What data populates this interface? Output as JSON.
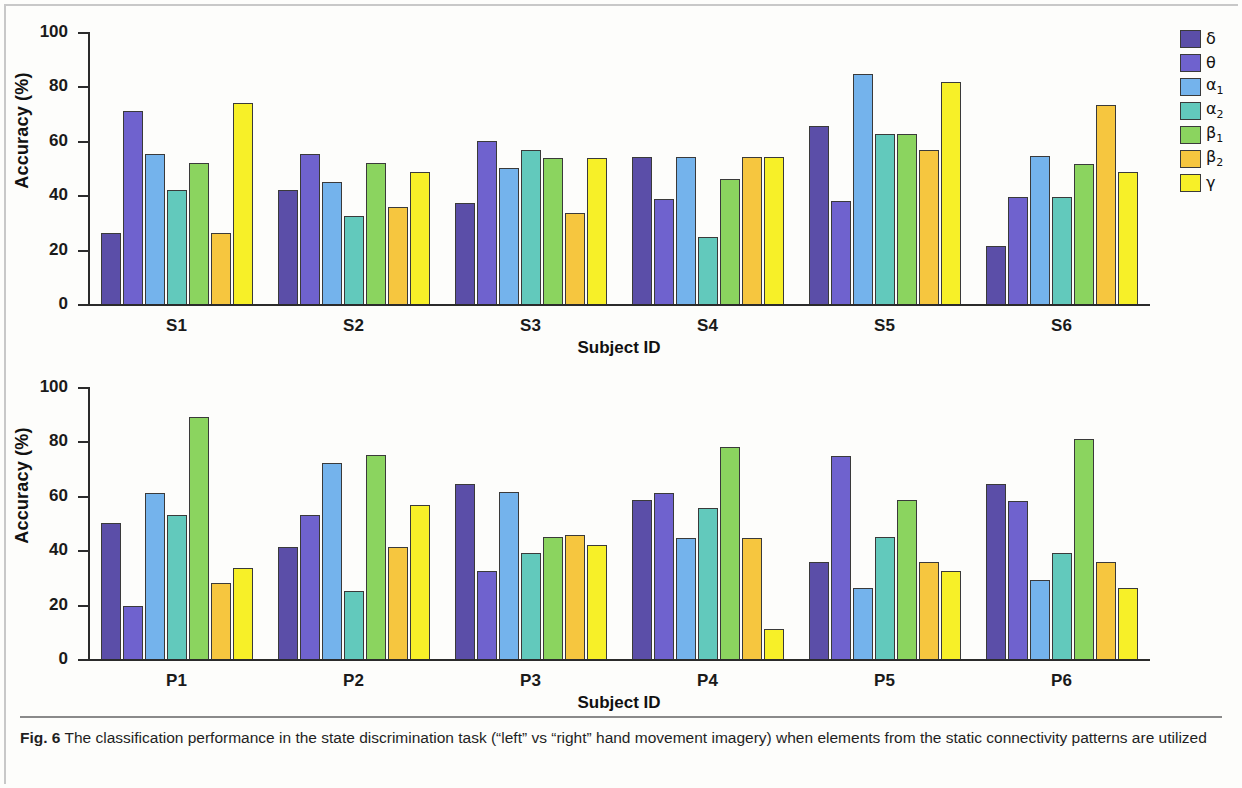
{
  "figure": {
    "label": "Fig. 6",
    "caption": " The classification performance in the state discrimination task (“left” vs “right” hand movement imagery) when elements from the static connectivity patterns are utilized"
  },
  "legend": {
    "position": "right",
    "entries": [
      {
        "name": "delta",
        "label": "δ",
        "sub": "",
        "color": "#5B4EA8"
      },
      {
        "name": "theta",
        "label": "θ",
        "sub": "",
        "color": "#6F62CE"
      },
      {
        "name": "alpha1",
        "label": "α",
        "sub": "1",
        "color": "#74B3EC"
      },
      {
        "name": "alpha2",
        "label": "α",
        "sub": "2",
        "color": "#62C9BC"
      },
      {
        "name": "beta1",
        "label": "β",
        "sub": "1",
        "color": "#8BD45F"
      },
      {
        "name": "beta2",
        "label": "β",
        "sub": "2",
        "color": "#F6C63F"
      },
      {
        "name": "gamma",
        "label": "γ",
        "sub": "",
        "color": "#F7F028"
      }
    ]
  },
  "chart_data": [
    {
      "panel": "top",
      "type": "bar",
      "title": "",
      "xlabel": "Subject ID",
      "ylabel": "Accuracy (%)",
      "ylim": [
        0,
        100
      ],
      "yticks": [
        0,
        20,
        40,
        60,
        80,
        100
      ],
      "grid": false,
      "categories": [
        "S1",
        "S2",
        "S3",
        "S4",
        "S5",
        "S6"
      ],
      "series": [
        {
          "name": "δ",
          "values": [
            26.0,
            42.0,
            37.0,
            54.0,
            65.5,
            21.5
          ]
        },
        {
          "name": "θ",
          "values": [
            71.0,
            55.0,
            60.0,
            38.5,
            38.0,
            39.5
          ]
        },
        {
          "name": "α₁",
          "values": [
            55.0,
            45.0,
            50.0,
            54.0,
            84.5,
            54.5
          ]
        },
        {
          "name": "α₂",
          "values": [
            42.0,
            32.5,
            56.5,
            24.5,
            62.5,
            39.5
          ]
        },
        {
          "name": "β₁",
          "values": [
            52.0,
            52.0,
            53.5,
            46.0,
            62.5,
            51.5
          ]
        },
        {
          "name": "β₂",
          "values": [
            26.0,
            35.5,
            33.5,
            54.0,
            56.5,
            73.0
          ]
        },
        {
          "name": "γ",
          "values": [
            74.0,
            48.5,
            53.5,
            54.0,
            81.5,
            48.5
          ]
        }
      ]
    },
    {
      "panel": "bottom",
      "type": "bar",
      "title": "",
      "xlabel": "Subject ID",
      "ylabel": "Accuracy (%)",
      "ylim": [
        0,
        100
      ],
      "yticks": [
        0,
        20,
        40,
        60,
        80,
        100
      ],
      "grid": false,
      "categories": [
        "P1",
        "P2",
        "P3",
        "P4",
        "P5",
        "P6"
      ],
      "series": [
        {
          "name": "δ",
          "values": [
            50.0,
            41.0,
            64.5,
            58.5,
            35.5,
            64.5
          ]
        },
        {
          "name": "θ",
          "values": [
            19.5,
            53.0,
            32.5,
            61.0,
            74.5,
            58.0
          ]
        },
        {
          "name": "α₁",
          "values": [
            61.0,
            72.0,
            61.5,
            44.5,
            26.0,
            29.0
          ]
        },
        {
          "name": "α₂",
          "values": [
            53.0,
            25.0,
            39.0,
            55.5,
            45.0,
            39.0
          ]
        },
        {
          "name": "β₁",
          "values": [
            89.0,
            75.0,
            45.0,
            78.0,
            58.5,
            81.0
          ]
        },
        {
          "name": "β₂",
          "values": [
            28.0,
            41.0,
            45.5,
            44.5,
            35.5,
            35.5
          ]
        },
        {
          "name": "γ",
          "values": [
            33.5,
            56.5,
            42.0,
            11.0,
            32.5,
            26.0
          ]
        }
      ]
    }
  ]
}
